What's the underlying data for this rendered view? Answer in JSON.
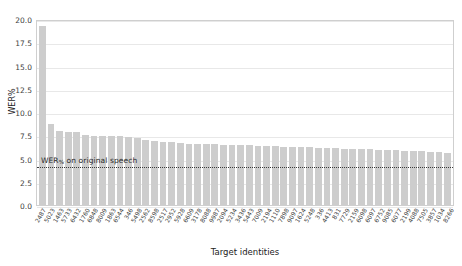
{
  "chart_data": {
    "type": "bar",
    "title": "",
    "xlabel": "Target identities",
    "ylabel": "WER%",
    "ylim": [
      0.0,
      20.0
    ],
    "yticks": [
      "0.0",
      "2.5",
      "5.0",
      "7.5",
      "10.0",
      "12.5",
      "15.0",
      "17.5",
      "20.0"
    ],
    "ytick_values": [
      0.0,
      2.5,
      5.0,
      7.5,
      10.0,
      12.5,
      15.0,
      17.5,
      20.0
    ],
    "grid": true,
    "legend": "none",
    "bar_color": "#cdcdcd",
    "annotation": {
      "text": "WER% on original speech",
      "text_main": "WER",
      "text_sub": "%",
      "text_rest": " on original speech",
      "value": 4.35,
      "style": "dotted",
      "color": "#3a3a3a"
    },
    "categories": [
      "2487",
      "5023",
      "1463",
      "5733",
      "6432",
      "1760",
      "6848",
      "8009",
      "1863",
      "6544",
      "346",
      "5498",
      "2562",
      "8598",
      "2517",
      "2952",
      "5928",
      "6609",
      "3178",
      "8088",
      "9987",
      "2094",
      "5234",
      "3436",
      "5443",
      "7009",
      "2194",
      "1110",
      "7898",
      "9097",
      "1624",
      "5248",
      "336",
      "4413",
      "831",
      "7729",
      "2159",
      "6098",
      "6097",
      "6752",
      "9085",
      "6077",
      "2199",
      "4088",
      "7505",
      "3857",
      "1034",
      "8266"
    ],
    "values": [
      19.3,
      8.7,
      8.0,
      7.9,
      7.9,
      7.5,
      7.4,
      7.4,
      7.4,
      7.4,
      7.3,
      7.2,
      7.0,
      6.9,
      6.8,
      6.8,
      6.7,
      6.6,
      6.6,
      6.6,
      6.6,
      6.5,
      6.5,
      6.5,
      6.4,
      6.3,
      6.3,
      6.3,
      6.2,
      6.2,
      6.2,
      6.2,
      6.1,
      6.1,
      6.1,
      6.0,
      6.0,
      6.0,
      6.0,
      5.9,
      5.9,
      5.9,
      5.8,
      5.8,
      5.8,
      5.7,
      5.7,
      5.6
    ]
  }
}
